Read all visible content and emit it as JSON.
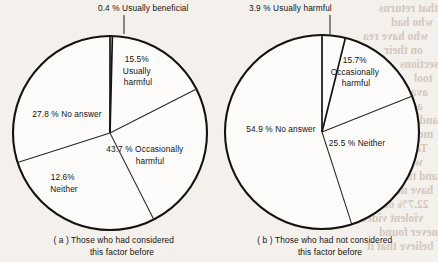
{
  "figure": {
    "background_color": "#f4f1ec",
    "ink_color": "#16130f"
  },
  "bleed_through_text": [
    "that returns",
    "who had",
    "who have rea",
    "on their",
    "sections",
    "tool",
    "available",
    "accounting",
    "and behaviour",
    "meaning",
    "Table 5",
    "who have lived",
    "and their weekly",
    "have never",
    "22.7% of were",
    "violent video",
    "never found",
    "believe that it"
  ],
  "chart_data": [
    {
      "type": "pie",
      "id": "chart-a",
      "title": "",
      "caption_line1": "( a ) Those who had considered",
      "caption_line2": "this factor before",
      "center": [
        110,
        133
      ],
      "radius": 97,
      "start_angle_deg": 0,
      "direction": "clockwise",
      "legend": "none",
      "labels_inline": true,
      "categories": [
        "Usually beneficial",
        "Usually harmful",
        "Occasionally harmful",
        "Neither",
        "No answer"
      ],
      "values": [
        0.4,
        15.5,
        43.7,
        12.6,
        27.8
      ],
      "value_unit": "%",
      "slices": [
        {
          "label": "Usually beneficial",
          "value": 0.4,
          "value_text": "0.4%",
          "label_text": "0.4 % Usually beneficial",
          "label_lines": [
            "0.4 % Usually beneficial"
          ],
          "label_x": 98,
          "label_y": 11,
          "anchor": "start",
          "leader": true,
          "leader_from": [
            124,
            15
          ],
          "leader_to": [
            124,
            34
          ]
        },
        {
          "label": "Usually harmful",
          "value": 15.5,
          "value_text": "15.5%",
          "label_lines": [
            "15.5%",
            "Usually",
            "harmful"
          ],
          "label_x": 138,
          "label_y": 62,
          "anchor": "middle",
          "leader": false
        },
        {
          "label": "Occasionally harmful",
          "value": 43.7,
          "value_text": "43.7%",
          "label_lines": [
            "43.7 % Occasionally",
            "harmful"
          ],
          "label_x": 146,
          "label_y": 152,
          "anchor": "middle",
          "leader": false
        },
        {
          "label": "Neither",
          "value": 12.6,
          "value_text": "12.6%",
          "label_lines": [
            "12.6%",
            "Neither"
          ],
          "label_x": 64,
          "label_y": 180,
          "anchor": "middle",
          "leader": false
        },
        {
          "label": "No answer",
          "value": 27.8,
          "value_text": "27.8%",
          "label_lines": [
            "27.8 % No answer"
          ],
          "label_x": 67,
          "label_y": 117,
          "anchor": "middle",
          "leader": false
        }
      ]
    },
    {
      "type": "pie",
      "id": "chart-b",
      "title": "",
      "caption_line1": "( b ) Those who had not considered",
      "caption_line2": "this factor before",
      "center": [
        322,
        132
      ],
      "radius": 97,
      "start_angle_deg": 0,
      "direction": "clockwise",
      "legend": "none",
      "labels_inline": true,
      "categories": [
        "Usually harmful",
        "Occasionally harmful",
        "Neither",
        "No answer"
      ],
      "values": [
        3.9,
        15.7,
        25.5,
        54.9
      ],
      "value_unit": "%",
      "slices": [
        {
          "label": "Usually harmful",
          "value": 3.9,
          "value_text": "3.9%",
          "label_lines": [
            "3.9 % Usually harmful"
          ],
          "label_x": 249,
          "label_y": 11,
          "anchor": "start",
          "leader": true,
          "leader_from": [
            330,
            15
          ],
          "leader_to": [
            330,
            36
          ]
        },
        {
          "label": "Occasionally harmful",
          "value": 15.7,
          "value_text": "15.7%",
          "label_lines": [
            "15.7%",
            "Occasionally",
            "harmful"
          ],
          "label_x": 356,
          "label_y": 63,
          "anchor": "middle",
          "leader": false
        },
        {
          "label": "Neither",
          "value": 25.5,
          "value_text": "25.5%",
          "label_lines": [
            "25.5 % Neither"
          ],
          "label_x": 357,
          "label_y": 146,
          "anchor": "middle",
          "leader": false
        },
        {
          "label": "No answer",
          "value": 54.9,
          "value_text": "54.9%",
          "label_lines": [
            "54.9 % No answer"
          ],
          "label_x": 281,
          "label_y": 132,
          "anchor": "middle",
          "leader": false
        }
      ]
    }
  ]
}
